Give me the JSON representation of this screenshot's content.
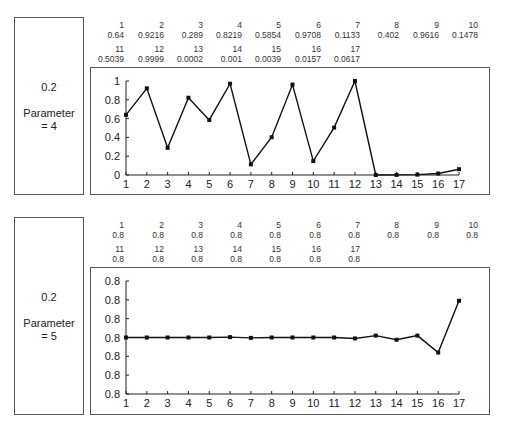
{
  "panels": [
    {
      "noise_label": "0.2",
      "param_label": "Parameter",
      "param_value": "= 4",
      "table": [
        {
          "n": "1",
          "v": "0.64"
        },
        {
          "n": "2",
          "v": "0.9216"
        },
        {
          "n": "3",
          "v": "0.289"
        },
        {
          "n": "4",
          "v": "0.8219"
        },
        {
          "n": "5",
          "v": "0.5854"
        },
        {
          "n": "6",
          "v": "0.9708"
        },
        {
          "n": "7",
          "v": "0.1133"
        },
        {
          "n": "8",
          "v": "0.402"
        },
        {
          "n": "9",
          "v": "0.9616"
        },
        {
          "n": "10",
          "v": "0.1478"
        },
        {
          "n": "11",
          "v": "0.5039"
        },
        {
          "n": "12",
          "v": "0.9999"
        },
        {
          "n": "13",
          "v": "0.0002"
        },
        {
          "n": "14",
          "v": "0.001"
        },
        {
          "n": "15",
          "v": "0.0039"
        },
        {
          "n": "16",
          "v": "0.0157"
        },
        {
          "n": "17",
          "v": "0.0617"
        }
      ]
    },
    {
      "noise_label": "0.2",
      "param_label": "Parameter",
      "param_value": "= 5",
      "table": [
        {
          "n": "1",
          "v": "0.8"
        },
        {
          "n": "2",
          "v": "0.8"
        },
        {
          "n": "3",
          "v": "0.8"
        },
        {
          "n": "4",
          "v": "0.8"
        },
        {
          "n": "5",
          "v": "0.8"
        },
        {
          "n": "6",
          "v": "0.8"
        },
        {
          "n": "7",
          "v": "0.8"
        },
        {
          "n": "8",
          "v": "0.8"
        },
        {
          "n": "9",
          "v": "0.8"
        },
        {
          "n": "10",
          "v": "0.8"
        },
        {
          "n": "11",
          "v": "0.8"
        },
        {
          "n": "12",
          "v": "0.8"
        },
        {
          "n": "13",
          "v": "0.8"
        },
        {
          "n": "14",
          "v": "0.8"
        },
        {
          "n": "15",
          "v": "0.8"
        },
        {
          "n": "16",
          "v": "0.8"
        },
        {
          "n": "17",
          "v": "0.8"
        }
      ]
    }
  ],
  "chart_data": [
    {
      "type": "line",
      "title": "",
      "xlabel": "",
      "ylabel": "",
      "x": [
        1,
        2,
        3,
        4,
        5,
        6,
        7,
        8,
        9,
        10,
        11,
        12,
        13,
        14,
        15,
        16,
        17
      ],
      "series": [
        {
          "name": "Parameter = 4",
          "values": [
            0.64,
            0.9216,
            0.289,
            0.8219,
            0.5854,
            0.9708,
            0.1133,
            0.402,
            0.9616,
            0.1478,
            0.5039,
            0.9999,
            0.0002,
            0.001,
            0.0039,
            0.0157,
            0.0617
          ]
        }
      ],
      "yticks": [
        "0",
        "0.2",
        "0.4",
        "0.6",
        "0.8",
        "1"
      ],
      "ylim": [
        0,
        1
      ],
      "grid": false,
      "marker": "square"
    },
    {
      "type": "line",
      "title": "",
      "xlabel": "",
      "ylabel": "",
      "x": [
        1,
        2,
        3,
        4,
        5,
        6,
        7,
        8,
        9,
        10,
        11,
        12,
        13,
        14,
        15,
        16,
        17
      ],
      "series": [
        {
          "name": "Parameter = 5 (relative position, all values display as 0.8)",
          "values": [
            3.0,
            3.0,
            3.0,
            3.0,
            3.0,
            3.02,
            2.98,
            3.0,
            3.0,
            3.0,
            3.0,
            2.95,
            3.1,
            2.88,
            3.1,
            2.2,
            4.95
          ]
        }
      ],
      "yticks": [
        "0.8",
        "0.8",
        "0.8",
        "0.8",
        "0.8",
        "0.8",
        "0.8"
      ],
      "ylim": [
        0,
        6
      ],
      "grid": false,
      "marker": "square"
    }
  ]
}
